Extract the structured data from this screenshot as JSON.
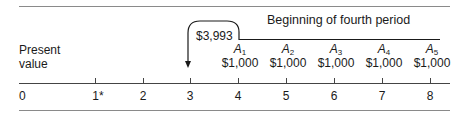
{
  "diagram": {
    "title": "Beginning of fourth period",
    "present_value_label": [
      "Present",
      "value"
    ],
    "present_value_amount": "$3,993",
    "timeline": {
      "ticks": [
        "0",
        "1*",
        "2",
        "3",
        "4",
        "5",
        "6",
        "7",
        "8"
      ],
      "tick_x": [
        21,
        95,
        143,
        190,
        238,
        286,
        334,
        382,
        430
      ]
    },
    "annuities": [
      {
        "symbol": "A",
        "sub": "1",
        "amount": "$1,000",
        "period": "4"
      },
      {
        "symbol": "A",
        "sub": "2",
        "amount": "$1,000",
        "period": "5"
      },
      {
        "symbol": "A",
        "sub": "3",
        "amount": "$1,000",
        "period": "6"
      },
      {
        "symbol": "A",
        "sub": "4",
        "amount": "$1,000",
        "period": "7"
      },
      {
        "symbol": "A",
        "sub": "5",
        "amount": "$1,000",
        "period": "8"
      }
    ],
    "colors": {
      "line": "#1a1a1a",
      "rule": "#8a8a8a"
    }
  }
}
